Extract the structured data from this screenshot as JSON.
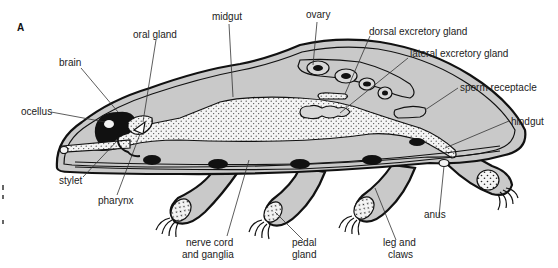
{
  "figure": {
    "panel_label": "A",
    "colors": {
      "body_fill": "#c9c9c9",
      "outline": "#111111",
      "gut_fill": "#f4f4f4",
      "background": "#ffffff"
    },
    "labels": {
      "midgut": "midgut",
      "ovary": "ovary",
      "oral_gland": "oral gland",
      "dorsal_excretory_gland": "dorsal excretory gland",
      "lateral_excretory_gland": "lateral excretory gland",
      "brain": "brain",
      "sperm_receptacle": "sperm receptacle",
      "ocellus": "ocellus",
      "hindgut": "hindgut",
      "stylet": "stylet",
      "pharynx": "pharynx",
      "anus": "anus",
      "nerve_cord_line1": "nerve cord",
      "nerve_cord_line2": "and ganglia",
      "pedal_gland_line1": "pedal",
      "pedal_gland_line2": "gland",
      "leg_claws_line1": "leg and",
      "leg_claws_line2": "claws"
    }
  }
}
